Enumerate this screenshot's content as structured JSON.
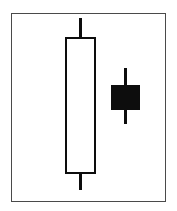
{
  "figure": {
    "title": "Bearish Harami Candlestick Pattern",
    "caption": "",
    "background_color": "#ffffff",
    "frame": {
      "name": "chart-frame",
      "border_color": "#4a4a4a",
      "border_width_px": 1.5,
      "x": 11,
      "y": 13,
      "width": 155,
      "height": 189
    }
  },
  "chart_data": {
    "type": "candlestick",
    "title": "Bearish Harami Candlestick Pattern",
    "subtitle": "",
    "xlabel": "",
    "ylabel": "",
    "grid": false,
    "legend": false,
    "axis_visible": false,
    "tick_labels": [],
    "annotations": [],
    "colors": {
      "bullish_fill": "#ffffff",
      "bullish_outline": "#0d0d0d",
      "bearish_fill": "#0d0d0d",
      "bearish_outline": "#0d0d0d",
      "wick": "#0d0d0d",
      "frame": "#4a4a4a",
      "background": "#ffffff"
    },
    "categories": [
      "1",
      "2"
    ],
    "series": [
      {
        "name": "Candle 1",
        "direction": "bullish",
        "open": 10,
        "high": 94,
        "low": 2,
        "close": 82,
        "label": "Large white bullish candle",
        "px": {
          "center_x": 80,
          "body_left": 65,
          "body_right": 96,
          "body_top": 37,
          "body_bottom": 174,
          "wick_top": 18,
          "wick_bottom": 190,
          "wick_width": 3
        }
      },
      {
        "name": "Candle 2",
        "direction": "bearish",
        "open": 68,
        "high": 82,
        "low": 49,
        "close": 55,
        "label": "Small black bearish candle",
        "px": {
          "center_x": 125,
          "body_left": 111,
          "body_right": 140,
          "body_top": 85,
          "body_bottom": 110,
          "wick_top": 68,
          "wick_bottom": 124,
          "wick_width": 3
        }
      }
    ]
  }
}
